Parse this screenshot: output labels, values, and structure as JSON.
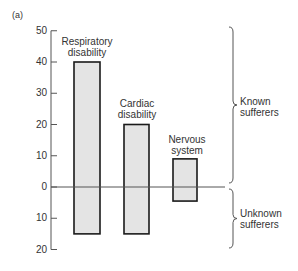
{
  "panel_label": "(a)",
  "chart_data": {
    "type": "bar",
    "title": "",
    "xlabel": "",
    "ylabel": "",
    "categories": [
      "Respiratory disability",
      "Cardiac disability",
      "Nervous system"
    ],
    "series": [
      {
        "name": "Known sufferers",
        "values": [
          40,
          20,
          9
        ]
      },
      {
        "name": "Unknown sufferers",
        "values": [
          15,
          15,
          4.5
        ]
      }
    ],
    "ylim": [
      -20,
      50
    ],
    "yticks": [
      50,
      40,
      30,
      20,
      10,
      0,
      10,
      20
    ],
    "grid": false,
    "annotations": [
      "Known sufferers",
      "Unknown sufferers"
    ],
    "bar_fill": "#e4e4e4",
    "bar_edge": "#1a1a1a"
  },
  "bars": [
    {
      "line1": "Respiratory",
      "line2": "disability"
    },
    {
      "line1": "Cardiac",
      "line2": "disability"
    },
    {
      "line1": "Nervous",
      "line2": "system"
    }
  ],
  "brace_labels": {
    "known_1": "Known",
    "known_2": "sufferers",
    "unknown_1": "Unknown",
    "unknown_2": "sufferers"
  }
}
